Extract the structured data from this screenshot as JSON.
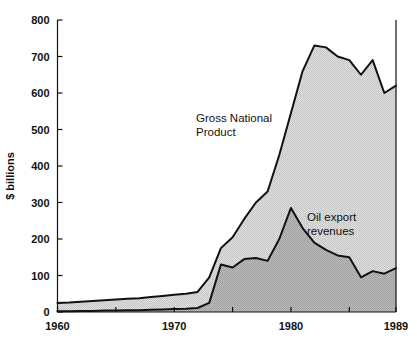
{
  "chart_data": {
    "type": "area",
    "title": "",
    "subtitle": "",
    "xlabel": "",
    "ylabel": "$ billions",
    "xlim": [
      1960,
      1989
    ],
    "ylim": [
      0,
      800
    ],
    "grid": false,
    "legend_position": "inline-annotations",
    "x": [
      1960,
      1961,
      1962,
      1963,
      1964,
      1965,
      1966,
      1967,
      1968,
      1969,
      1970,
      1971,
      1972,
      1973,
      1974,
      1975,
      1976,
      1977,
      1978,
      1979,
      1980,
      1981,
      1982,
      1983,
      1984,
      1985,
      1986,
      1987,
      1988,
      1989
    ],
    "x_tick_labels": [
      "1960",
      "1970",
      "1980",
      "1989"
    ],
    "x_tick_values": [
      1960,
      1970,
      1980,
      1989
    ],
    "x_minor_tick_values": [
      1965,
      1975,
      1985
    ],
    "y_tick_labels": [
      "0",
      "100",
      "200",
      "300",
      "400",
      "500",
      "600",
      "700",
      "800"
    ],
    "y_tick_values": [
      0,
      100,
      200,
      300,
      400,
      500,
      600,
      700,
      800
    ],
    "series": [
      {
        "name": "Gross National Product",
        "fill_color": "#d9d9d9",
        "line_color": "#111111",
        "label_text_line1": "Gross National",
        "label_text_line2": "Product",
        "values": [
          25,
          26,
          28,
          30,
          32,
          34,
          36,
          38,
          41,
          44,
          47,
          50,
          55,
          95,
          175,
          205,
          255,
          300,
          330,
          430,
          545,
          660,
          730,
          725,
          700,
          690,
          650,
          690,
          600,
          620
        ]
      },
      {
        "name": "Oil export revenues",
        "fill_color": "#b0b0b0",
        "line_color": "#111111",
        "label_text_line1": "Oil export",
        "label_text_line2": "revenues",
        "values": [
          2,
          2,
          3,
          3,
          4,
          4,
          5,
          5,
          6,
          7,
          8,
          9,
          11,
          25,
          130,
          122,
          145,
          148,
          140,
          200,
          285,
          230,
          190,
          170,
          155,
          150,
          95,
          112,
          105,
          120
        ]
      }
    ]
  },
  "axes": {
    "y_axis_title": "$ billions",
    "x_first_label": "1960",
    "x_mid_label": "1970",
    "x_late_label": "1980",
    "x_last_label": "1989"
  },
  "annotations": {
    "gnp_line1": "Gross National",
    "gnp_line2": "Product",
    "oil_line1": "Oil export",
    "oil_line2": "revenues"
  }
}
